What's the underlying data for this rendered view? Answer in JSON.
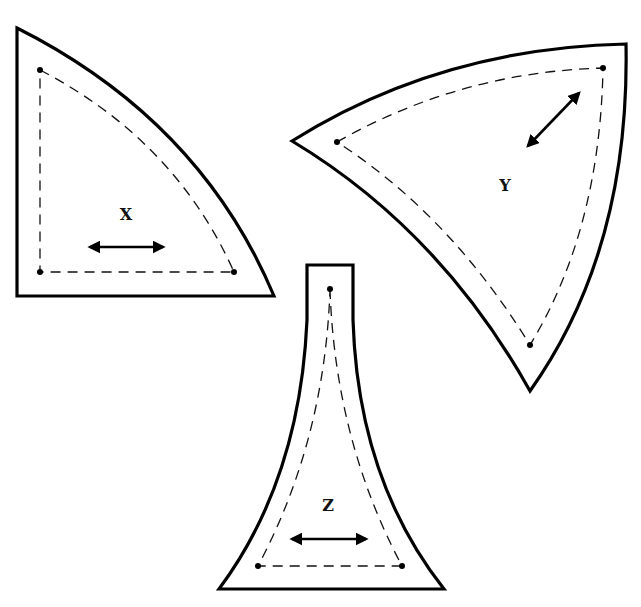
{
  "diagram": {
    "type": "sewing-pattern-pieces",
    "pieces": [
      {
        "id": "X",
        "label": "X",
        "shape": "quarter-circle wedge (straight left and bottom edges, convex curved hypotenuse)",
        "seam_line": "dashed",
        "corner_dots": 3,
        "grainline_arrow": "horizontal, double-headed"
      },
      {
        "id": "Y",
        "label": "Y",
        "shape": "curved triangle (convex top and right edges, concave lower-left edge)",
        "seam_line": "dashed",
        "corner_dots": 3,
        "grainline_arrow": "diagonal, double-headed"
      },
      {
        "id": "Z",
        "label": "Z",
        "shape": "flared trumpet (narrow top, concave sides, wide straight base)",
        "seam_line": "dashed",
        "corner_dots": 3,
        "grainline_arrow": "horizontal, double-headed"
      }
    ],
    "colors": {
      "background": "#ffffff",
      "stroke": "#000000"
    }
  }
}
